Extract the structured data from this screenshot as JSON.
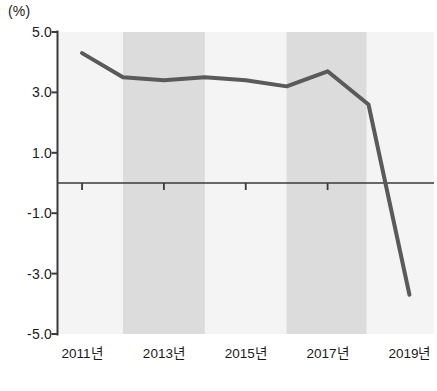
{
  "chart_data": {
    "type": "line",
    "title": "",
    "subtitle": "",
    "unit_label": "(%)",
    "xlabel": "",
    "ylabel": "",
    "ylim": [
      -5.0,
      5.0
    ],
    "ytick_labels": [
      "5.0",
      "3.0",
      "1.0",
      "-1.0",
      "-3.0",
      "-5.0"
    ],
    "ytick_values": [
      5.0,
      3.0,
      1.0,
      -1.0,
      -3.0,
      -5.0
    ],
    "xtick_labels": [
      "2011년",
      "2013년",
      "2015년",
      "2017년",
      "2019년"
    ],
    "xtick_values": [
      2011,
      2013,
      2015,
      2017,
      2019
    ],
    "categories": [
      2011,
      2012,
      2013,
      2014,
      2015,
      2016,
      2017,
      2018,
      2019
    ],
    "series": [
      {
        "name": "증감률",
        "values": [
          4.3,
          3.5,
          3.4,
          3.5,
          3.4,
          3.2,
          3.7,
          2.6,
          -3.7
        ],
        "color": "#5a5a5a",
        "line_width": 4
      }
    ],
    "zero_line": 0.0,
    "grid": false,
    "legend": "none",
    "shaded_bands": [
      {
        "start": 2012.0,
        "end": 2014.0,
        "color": "#dcdcdc"
      },
      {
        "start": 2016.0,
        "end": 2017.95,
        "color": "#dcdcdc"
      }
    ],
    "plot_background": "#f4f4f4",
    "axis_color": "#3a3a3a",
    "caption": ""
  },
  "axes": {
    "unit": "(%)"
  }
}
